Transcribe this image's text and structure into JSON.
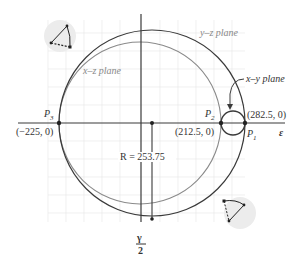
{
  "diagram": {
    "type": "Mohr's circle (3D stress state)",
    "horizontal_axis_label": "ε",
    "vertical_axis_label_num": "γ",
    "vertical_axis_label_den": "2",
    "circles": [
      {
        "name": "y–z plane",
        "label": "y–z plane",
        "style": "dark"
      },
      {
        "name": "x–z plane",
        "label": "x–z plane",
        "style": "light"
      },
      {
        "name": "x–y plane",
        "label": "x–y plane",
        "style": "dark-small"
      }
    ],
    "points": [
      {
        "id": "P3",
        "label_main": "P",
        "label_sub": "3",
        "coord": "(−225, 0)"
      },
      {
        "id": "P2",
        "label_main": "P",
        "label_sub": "2",
        "coord": "(212.5, 0)"
      },
      {
        "id": "P1",
        "label_main": "P",
        "label_sub": "1",
        "coord": "(282.5, 0)"
      }
    ],
    "radius_label": "R = 253.75",
    "colors": {
      "dark_line": "#3a3a3a",
      "light_line": "#8a8a8a",
      "grid": "#e4e4e4",
      "icon_bg": "#ececec"
    }
  }
}
